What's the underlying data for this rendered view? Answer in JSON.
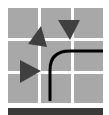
{
  "icon": {
    "name": "routing-grid-icon",
    "colors": {
      "background": "#ffffff",
      "cell": "#a8a8a8",
      "triangle": "#404040",
      "curve": "#000000",
      "bar": "#3a3a3a"
    },
    "grid": {
      "rows": 3,
      "cols": 3
    },
    "triangles": [
      {
        "name": "triangle-up-left",
        "direction": "up-left"
      },
      {
        "name": "triangle-down",
        "direction": "down"
      },
      {
        "name": "triangle-right",
        "direction": "right"
      }
    ]
  }
}
